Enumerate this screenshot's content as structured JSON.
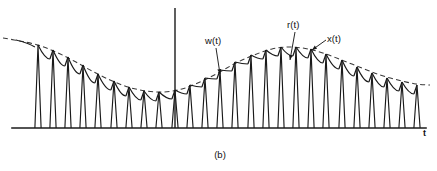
{
  "figure": {
    "caption": "(b)",
    "axis": {
      "x_label": "t",
      "x_axis_y": 128,
      "x_axis_start": 12,
      "x_axis_end": 426,
      "v_axis_x": 175,
      "v_axis_top": 8,
      "v_axis_bottom": 128
    },
    "annotations": [
      {
        "id": "w",
        "label": "w(t)",
        "text_x": 205,
        "text_y": 44,
        "leader_from_x": 216,
        "leader_from_y": 48,
        "leader_to_x": 220,
        "leader_to_y": 74
      },
      {
        "id": "r",
        "label": "r(t)",
        "text_x": 287,
        "text_y": 28,
        "leader_from_x": 295,
        "leader_from_y": 32,
        "leader_to_x": 290,
        "leader_to_y": 60
      },
      {
        "id": "x",
        "label": "x(t)",
        "text_x": 327,
        "text_y": 42,
        "leader_from_x": 326,
        "leader_from_y": 40,
        "leader_to_x": 312,
        "leader_to_y": 50
      }
    ]
  },
  "chart_data": {
    "type": "line",
    "title": "",
    "subtitle": "",
    "xlabel": "t",
    "ylabel": "",
    "grid": false,
    "legend_position": "inline-annotations",
    "xlim": [
      0,
      437
    ],
    "ylim_pixels_top_to_bottom": [
      8,
      128
    ],
    "baseline_y": 128,
    "series": [
      {
        "name": "w(t)",
        "style": "dashed",
        "role": "message-envelope",
        "points": [
          [
            3,
            38
          ],
          [
            20,
            41
          ],
          [
            38,
            45
          ],
          [
            56,
            52
          ],
          [
            74,
            61
          ],
          [
            92,
            71
          ],
          [
            110,
            80
          ],
          [
            128,
            87
          ],
          [
            146,
            91
          ],
          [
            164,
            92
          ],
          [
            182,
            89
          ],
          [
            200,
            82
          ],
          [
            218,
            73
          ],
          [
            236,
            63
          ],
          [
            254,
            55
          ],
          [
            272,
            49
          ],
          [
            290,
            47
          ],
          [
            308,
            49
          ],
          [
            326,
            54
          ],
          [
            344,
            61
          ],
          [
            362,
            68
          ],
          [
            380,
            75
          ],
          [
            398,
            80
          ],
          [
            416,
            84
          ],
          [
            430,
            85
          ]
        ]
      },
      {
        "name": "r(t)",
        "style": "solid",
        "role": "reconstructed-decay",
        "note": "RC-type decay from each sample peak to the next sample instant"
      },
      {
        "name": "x(t)",
        "style": "solid",
        "role": "sampling-pulses",
        "note": "narrow triangular sampling pulses rising from the t axis to the envelope"
      }
    ],
    "pulse_spacing_px": 15.2,
    "pulse_count": 26,
    "pulse_first_x": 38,
    "pulse_half_width_px": 3.1,
    "peaks": [
      {
        "x": 38,
        "y": 45
      },
      {
        "x": 53,
        "y": 50
      },
      {
        "x": 68,
        "y": 57
      },
      {
        "x": 83,
        "y": 65
      },
      {
        "x": 98,
        "y": 74
      },
      {
        "x": 114,
        "y": 81
      },
      {
        "x": 129,
        "y": 87
      },
      {
        "x": 144,
        "y": 91
      },
      {
        "x": 159,
        "y": 92
      },
      {
        "x": 175,
        "y": 90
      },
      {
        "x": 190,
        "y": 85
      },
      {
        "x": 205,
        "y": 78
      },
      {
        "x": 220,
        "y": 70
      },
      {
        "x": 235,
        "y": 62
      },
      {
        "x": 251,
        "y": 55
      },
      {
        "x": 266,
        "y": 50
      },
      {
        "x": 281,
        "y": 47
      },
      {
        "x": 296,
        "y": 47
      },
      {
        "x": 311,
        "y": 49
      },
      {
        "x": 326,
        "y": 54
      },
      {
        "x": 342,
        "y": 60
      },
      {
        "x": 357,
        "y": 67
      },
      {
        "x": 372,
        "y": 73
      },
      {
        "x": 387,
        "y": 78
      },
      {
        "x": 402,
        "y": 82
      },
      {
        "x": 417,
        "y": 85
      }
    ]
  }
}
